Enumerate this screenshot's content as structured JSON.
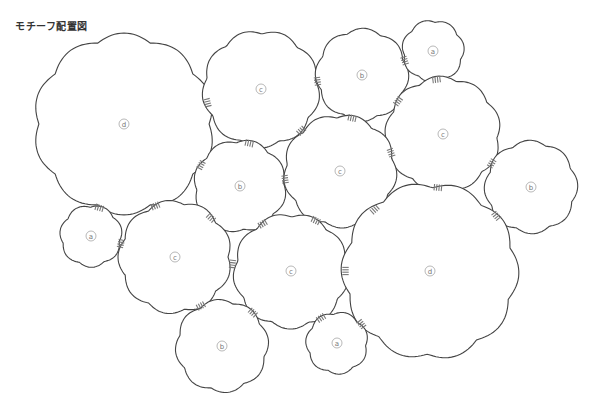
{
  "title": "モチーフ配置図",
  "colors": {
    "outline": "#444444",
    "stitch": "#777777",
    "label": "#777777"
  },
  "motifs": [
    {
      "label": "d",
      "cx": 124,
      "cy": 124,
      "r": 88,
      "lobes": 10
    },
    {
      "label": "c",
      "cx": 261,
      "cy": 89,
      "r": 57,
      "lobes": 9
    },
    {
      "label": "b",
      "cx": 362,
      "cy": 75,
      "r": 45,
      "lobes": 8
    },
    {
      "label": "a",
      "cx": 433,
      "cy": 51,
      "r": 30,
      "lobes": 7
    },
    {
      "label": "c",
      "cx": 443,
      "cy": 134,
      "r": 56,
      "lobes": 9
    },
    {
      "label": "b",
      "cx": 240,
      "cy": 186,
      "r": 45,
      "lobes": 8
    },
    {
      "label": "c",
      "cx": 340,
      "cy": 171,
      "r": 55,
      "lobes": 9
    },
    {
      "label": "b",
      "cx": 531,
      "cy": 187,
      "r": 45,
      "lobes": 8
    },
    {
      "label": "a",
      "cx": 91,
      "cy": 236,
      "r": 30,
      "lobes": 7
    },
    {
      "label": "c",
      "cx": 175,
      "cy": 257,
      "r": 55,
      "lobes": 9
    },
    {
      "label": "c",
      "cx": 291,
      "cy": 271,
      "r": 56,
      "lobes": 9
    },
    {
      "label": "d",
      "cx": 430,
      "cy": 271,
      "r": 86,
      "lobes": 10
    },
    {
      "label": "b",
      "cx": 222,
      "cy": 346,
      "r": 45,
      "lobes": 8
    },
    {
      "label": "a",
      "cx": 337,
      "cy": 343,
      "r": 30,
      "lobes": 7
    }
  ],
  "joins": [
    [
      0,
      1
    ],
    [
      0,
      5
    ],
    [
      0,
      8
    ],
    [
      0,
      9
    ],
    [
      1,
      2
    ],
    [
      1,
      5
    ],
    [
      1,
      6
    ],
    [
      2,
      3
    ],
    [
      2,
      4
    ],
    [
      2,
      6
    ],
    [
      3,
      4
    ],
    [
      4,
      6
    ],
    [
      4,
      7
    ],
    [
      4,
      11
    ],
    [
      5,
      6
    ],
    [
      5,
      9
    ],
    [
      5,
      10
    ],
    [
      6,
      10
    ],
    [
      6,
      11
    ],
    [
      7,
      11
    ],
    [
      8,
      9
    ],
    [
      9,
      10
    ],
    [
      9,
      12
    ],
    [
      10,
      11
    ],
    [
      10,
      12
    ],
    [
      10,
      13
    ],
    [
      11,
      13
    ]
  ]
}
